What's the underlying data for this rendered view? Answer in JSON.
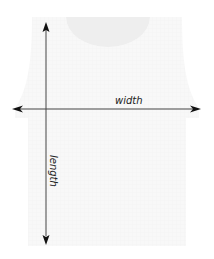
{
  "diagram": {
    "type": "garment-measurement",
    "garment": "tank-top",
    "labels": {
      "width": "width",
      "length": "length"
    },
    "colors": {
      "garment_fill": "#f7f7f7",
      "neckline_fill": "#efefef",
      "arrow": "#333333",
      "text": "#222222"
    }
  }
}
